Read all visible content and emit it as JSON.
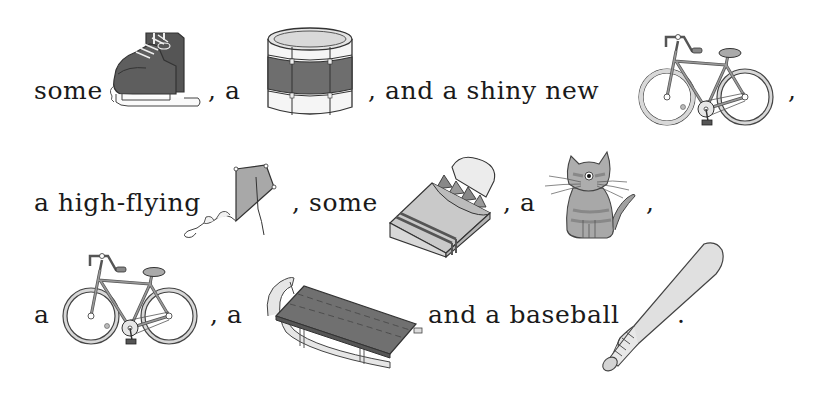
{
  "rebus": {
    "lines": [
      {
        "segments": [
          {
            "type": "text",
            "value": "some"
          },
          {
            "type": "picture",
            "icon": "ice-skates-icon",
            "label": "ice skates"
          },
          {
            "type": "text",
            "value": ", a"
          },
          {
            "type": "picture",
            "icon": "drum-icon",
            "label": "drum"
          },
          {
            "type": "text",
            "value": ", and a shiny new"
          },
          {
            "type": "picture",
            "icon": "bicycle-icon",
            "label": "bicycle"
          },
          {
            "type": "text",
            "value": ","
          }
        ]
      },
      {
        "segments": [
          {
            "type": "text",
            "value": "a high-flying"
          },
          {
            "type": "picture",
            "icon": "kite-icon",
            "label": "kite"
          },
          {
            "type": "text",
            "value": ", some"
          },
          {
            "type": "picture",
            "icon": "crayons-icon",
            "label": "crayons"
          },
          {
            "type": "text",
            "value": ", a"
          },
          {
            "type": "picture",
            "icon": "cat-icon",
            "label": "cat"
          },
          {
            "type": "text",
            "value": ","
          }
        ]
      },
      {
        "segments": [
          {
            "type": "text",
            "value": "a"
          },
          {
            "type": "picture",
            "icon": "bicycle-icon",
            "label": "bicycle"
          },
          {
            "type": "text",
            "value": ", a"
          },
          {
            "type": "picture",
            "icon": "sled-icon",
            "label": "sled"
          },
          {
            "type": "text",
            "value": "and a baseball"
          },
          {
            "type": "picture",
            "icon": "baseball-bat-icon",
            "label": "bat"
          },
          {
            "type": "text",
            "value": "."
          }
        ]
      }
    ]
  },
  "colors": {
    "text": "#1a1a1a",
    "ink": "#333333",
    "dark_fill": "#6b6b6b",
    "mid_fill": "#8c8c8c",
    "light_fill": "#d6d6d6",
    "paper": "#ffffff"
  }
}
